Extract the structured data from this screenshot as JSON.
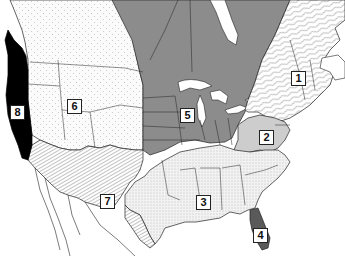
{
  "map": {
    "title": "North American regions map",
    "colors": {
      "background": "#ffffff",
      "border": "#222222",
      "region5_fill": "#8a8a8a",
      "region8_fill": "#000000",
      "region4_fill": "#5a5a5a",
      "region2_fill": "#c8c8c8",
      "dotted_fill": "#f4f4f4",
      "hatch_fill": "#ffffff",
      "water": "#ffffff"
    },
    "regions": [
      {
        "id": "1",
        "label": "1",
        "pattern": "wavy-hatch",
        "area": "Northeast / New England & Eastern Canada"
      },
      {
        "id": "2",
        "label": "2",
        "pattern": "light-gray",
        "area": "Mid-Atlantic"
      },
      {
        "id": "3",
        "label": "3",
        "pattern": "fine-dots",
        "area": "Southeast / South Central"
      },
      {
        "id": "4",
        "label": "4",
        "pattern": "dark-gray",
        "area": "Florida"
      },
      {
        "id": "5",
        "label": "5",
        "pattern": "medium-gray",
        "area": "Midwest / Central Canada"
      },
      {
        "id": "6",
        "label": "6",
        "pattern": "sparse-dots",
        "area": "Mountain West / Western Canada"
      },
      {
        "id": "7",
        "label": "7",
        "pattern": "diagonal-hatch",
        "area": "Southwest"
      },
      {
        "id": "8",
        "label": "8",
        "pattern": "solid-black",
        "area": "Pacific Coast"
      }
    ]
  }
}
